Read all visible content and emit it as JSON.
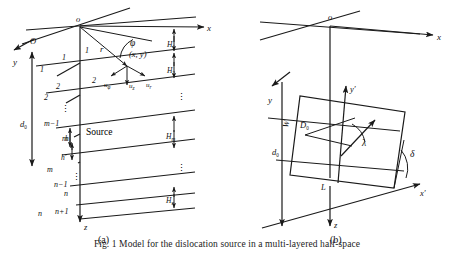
{
  "figure": {
    "caption": "Fig. 1   Model for the dislocation source in a multi-layered half-space",
    "panels": [
      {
        "id": "a",
        "label": "(a)",
        "title": "layered half-space with point source"
      },
      {
        "id": "b",
        "label": "(b)",
        "title": "finite rectangular fault geometry"
      }
    ]
  },
  "panel_a": {
    "origin_label": "o",
    "origin_label_secondary": "O",
    "axes": [
      {
        "name": "x-axis",
        "label": "x"
      },
      {
        "name": "y-axis",
        "label": "y"
      },
      {
        "name": "z-axis",
        "label": "z"
      }
    ],
    "source_label": "Source",
    "receiver_label": "(x, y)",
    "radial_distance_label": "r",
    "azimuth_label": "φ",
    "displacements": [
      {
        "name": "u-phi",
        "label": "u",
        "sub": "φ"
      },
      {
        "name": "u-z",
        "label": "u",
        "sub": "z"
      },
      {
        "name": "u-r",
        "label": "u",
        "sub": "r"
      }
    ],
    "depth_label": {
      "label": "d",
      "sub": "0"
    },
    "source_offsets": [
      {
        "name": "h",
        "label": "h"
      },
      {
        "name": "h-prime",
        "label": "h′"
      }
    ],
    "interface_numbers": [
      "1",
      "2",
      "m−1",
      "m",
      "n−1",
      "n"
    ],
    "layer_numbers": [
      "1",
      "2",
      "m",
      "n",
      "n+1"
    ],
    "layer_thicknesses": [
      {
        "label": "H",
        "sub": "1"
      },
      {
        "label": "H",
        "sub": "2"
      },
      {
        "label": "H",
        "sub": "m"
      },
      {
        "label": "H",
        "sub": "n"
      }
    ],
    "vertical_ellipsis": "⋮"
  },
  "panel_b": {
    "origin_label": "o",
    "axes": [
      {
        "name": "x-axis",
        "label": "x"
      },
      {
        "name": "y-axis",
        "label": "y"
      },
      {
        "name": "z-axis",
        "label": "z"
      },
      {
        "name": "x-prime-axis",
        "label": "x′"
      },
      {
        "name": "y-prime-axis",
        "label": "y′"
      }
    ],
    "fault_reference_point": "L",
    "fault_depth": {
      "label": "d",
      "sub": "0"
    },
    "fault_width": "W",
    "slip_vector": {
      "label": "D",
      "sub": "0"
    },
    "rake_angle": "λ",
    "dip_angle": "δ"
  }
}
